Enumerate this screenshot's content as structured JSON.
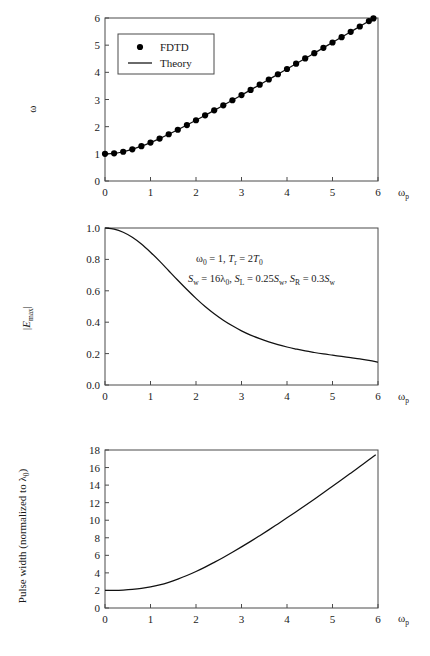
{
  "figure": {
    "background": "#ffffff",
    "ink": "#111111",
    "axis_color": "#4a4a4a"
  },
  "chart_data": [
    {
      "type": "line",
      "panel": "top",
      "title": "",
      "xlabel": "ωp",
      "ylabel": "ω",
      "xlim": [
        0,
        6
      ],
      "ylim": [
        0,
        6
      ],
      "xticks": [
        "0",
        "1",
        "2",
        "3",
        "4",
        "5",
        "6"
      ],
      "yticks": [
        "0",
        "1",
        "2",
        "3",
        "4",
        "5",
        "6"
      ],
      "grid": false,
      "legend_position": "upper-left",
      "legend": [
        {
          "label": "FDTD",
          "marker": "filled-circle"
        },
        {
          "label": "Theory",
          "marker": "line"
        }
      ],
      "series": [
        {
          "name": "Theory",
          "style": "line",
          "x": [
            0,
            0.2,
            0.4,
            0.6,
            0.8,
            1.0,
            1.2,
            1.4,
            1.6,
            1.8,
            2.0,
            2.2,
            2.4,
            2.6,
            2.8,
            3.0,
            3.2,
            3.4,
            3.6,
            3.8,
            4.0,
            4.2,
            4.4,
            4.6,
            4.8,
            5.0,
            5.2,
            5.4,
            5.6,
            5.8,
            5.9
          ],
          "values": [
            1.0,
            1.02,
            1.077,
            1.166,
            1.281,
            1.414,
            1.562,
            1.72,
            1.887,
            2.059,
            2.236,
            2.417,
            2.6,
            2.786,
            2.973,
            3.162,
            3.353,
            3.544,
            3.736,
            3.929,
            4.123,
            4.317,
            4.512,
            4.707,
            4.903,
            5.099,
            5.295,
            5.492,
            5.688,
            5.885,
            5.984
          ]
        },
        {
          "name": "FDTD",
          "style": "markers",
          "x": [
            0,
            0.2,
            0.4,
            0.6,
            0.8,
            1.0,
            1.2,
            1.4,
            1.6,
            1.8,
            2.0,
            2.2,
            2.4,
            2.6,
            2.8,
            3.0,
            3.2,
            3.4,
            3.6,
            3.8,
            4.0,
            4.2,
            4.4,
            4.6,
            4.8,
            5.0,
            5.2,
            5.4,
            5.6,
            5.8,
            5.9
          ],
          "values": [
            1.0,
            1.02,
            1.077,
            1.166,
            1.281,
            1.414,
            1.562,
            1.72,
            1.887,
            2.059,
            2.236,
            2.417,
            2.6,
            2.786,
            2.973,
            3.162,
            3.353,
            3.544,
            3.736,
            3.929,
            4.123,
            4.317,
            4.512,
            4.707,
            4.903,
            5.099,
            5.295,
            5.492,
            5.688,
            5.885,
            5.984
          ]
        }
      ]
    },
    {
      "type": "line",
      "panel": "middle",
      "title": "",
      "xlabel": "ωp",
      "ylabel": "|Emax|",
      "xlim": [
        0,
        6
      ],
      "ylim": [
        0,
        1.0
      ],
      "xticks": [
        "0",
        "1",
        "2",
        "3",
        "4",
        "5",
        "6"
      ],
      "yticks": [
        "0.0",
        "0.2",
        "0.4",
        "0.6",
        "0.8",
        "1.0"
      ],
      "grid": false,
      "annotations": [
        "ω0 = 1, Tr = 2T0",
        "Sw = 16λ0, SL = 0.25Sw, SR = 0.3Sw"
      ],
      "series": [
        {
          "name": "|Emax|",
          "style": "line",
          "x": [
            0,
            0.2,
            0.4,
            0.6,
            0.8,
            1.0,
            1.2,
            1.4,
            1.6,
            1.8,
            2.0,
            2.2,
            2.4,
            2.6,
            2.8,
            3.0,
            3.2,
            3.4,
            3.6,
            3.8,
            4.0,
            4.2,
            4.4,
            4.6,
            4.8,
            5.0,
            5.2,
            5.4,
            5.6,
            5.8,
            6.0
          ],
          "values": [
            1.0,
            0.993,
            0.973,
            0.941,
            0.898,
            0.846,
            0.789,
            0.728,
            0.667,
            0.608,
            0.552,
            0.5,
            0.454,
            0.413,
            0.377,
            0.345,
            0.318,
            0.295,
            0.275,
            0.257,
            0.242,
            0.229,
            0.217,
            0.207,
            0.198,
            0.19,
            0.182,
            0.174,
            0.166,
            0.157,
            0.145
          ]
        }
      ]
    },
    {
      "type": "line",
      "panel": "bottom",
      "title": "",
      "xlabel": "ωp",
      "ylabel": "Pulse width (normalized to λ0)",
      "xlim": [
        0,
        6
      ],
      "ylim": [
        0,
        18
      ],
      "xticks": [
        "0",
        "1",
        "2",
        "3",
        "4",
        "5",
        "6"
      ],
      "yticks": [
        "0",
        "2",
        "4",
        "6",
        "8",
        "10",
        "12",
        "14",
        "16",
        "18"
      ],
      "grid": false,
      "series": [
        {
          "name": "Pulse width",
          "style": "line",
          "x": [
            0,
            0.2,
            0.4,
            0.6,
            0.8,
            1.0,
            1.2,
            1.4,
            1.6,
            1.8,
            2.0,
            2.2,
            2.4,
            2.6,
            2.8,
            3.0,
            3.2,
            3.4,
            3.6,
            3.8,
            4.0,
            4.2,
            4.4,
            4.6,
            4.8,
            5.0,
            5.2,
            5.4,
            5.6,
            5.8,
            5.95
          ],
          "values": [
            2.0,
            2.01,
            2.05,
            2.12,
            2.23,
            2.4,
            2.63,
            2.93,
            3.29,
            3.7,
            4.16,
            4.66,
            5.2,
            5.76,
            6.35,
            6.96,
            7.59,
            8.24,
            8.9,
            9.58,
            10.27,
            10.97,
            11.68,
            12.4,
            13.13,
            13.87,
            14.61,
            15.36,
            16.12,
            16.88,
            17.46
          ]
        }
      ]
    }
  ],
  "labels": {
    "omega": "ω",
    "omega_p_base": "ω",
    "omega_p_sub": "p",
    "E_base": "E",
    "E_sub": "max",
    "bar": "|",
    "pulse_width_text": "Pulse width (normalized to λ",
    "pulse_width_sub": "0",
    "pulse_width_close": ")",
    "legend_fdtd": "FDTD",
    "legend_theory": "Theory"
  },
  "annotation_parts": {
    "line1": [
      {
        "t": "ω",
        "k": "n"
      },
      {
        "t": "0",
        "k": "s"
      },
      {
        "t": " = 1, ",
        "k": "n"
      },
      {
        "t": "T",
        "k": "i"
      },
      {
        "t": "r",
        "k": "s"
      },
      {
        "t": " = 2",
        "k": "n"
      },
      {
        "t": "T",
        "k": "i"
      },
      {
        "t": "0",
        "k": "s"
      }
    ],
    "line2": [
      {
        "t": "S",
        "k": "i"
      },
      {
        "t": "w",
        "k": "s"
      },
      {
        "t": " = 16",
        "k": "n"
      },
      {
        "t": "λ",
        "k": "n"
      },
      {
        "t": "0",
        "k": "s"
      },
      {
        "t": ", ",
        "k": "n"
      },
      {
        "t": "S",
        "k": "i"
      },
      {
        "t": "L",
        "k": "s"
      },
      {
        "t": " = 0.25",
        "k": "n"
      },
      {
        "t": "S",
        "k": "i"
      },
      {
        "t": "w",
        "k": "s"
      },
      {
        "t": ", ",
        "k": "n"
      },
      {
        "t": "S",
        "k": "i"
      },
      {
        "t": "R",
        "k": "s"
      },
      {
        "t": " = 0.3",
        "k": "n"
      },
      {
        "t": "S",
        "k": "i"
      },
      {
        "t": "w",
        "k": "s"
      }
    ]
  }
}
